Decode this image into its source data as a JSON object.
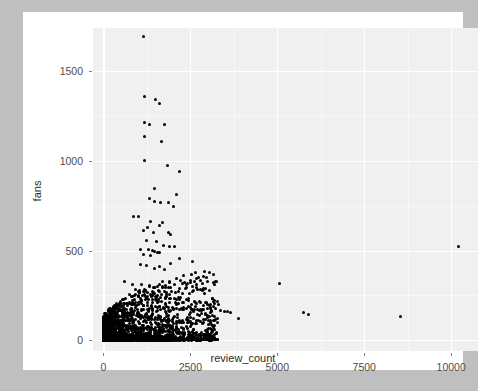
{
  "window": {
    "backdrop_color": "#bfbfbf",
    "card_color": "#ffffff"
  },
  "chart_data": {
    "type": "scatter",
    "title": "",
    "xlabel": "review_count",
    "ylabel": "fans",
    "xlim": [
      -300,
      10800
    ],
    "ylim": [
      -60,
      1740
    ],
    "xticks": [
      0,
      2500,
      5000,
      7500,
      10000
    ],
    "yticks": [
      0,
      500,
      1000,
      1500
    ],
    "xtick_labels": [
      "0",
      "2500",
      "5000",
      "7500",
      "10000"
    ],
    "ytick_labels": [
      "0",
      "500",
      "1000",
      "1500"
    ],
    "grid": true,
    "grid_color": "#ffffff",
    "panel_color": "#f0f0f0",
    "point_color": "#000000",
    "point_size": 3,
    "legend": "none",
    "n_points_note": "dense cluster near origin; sparse high-fan and high-review outliers",
    "points": [
      [
        1160,
        1690
      ],
      [
        1170,
        1360
      ],
      [
        1500,
        1340
      ],
      [
        1620,
        1320
      ],
      [
        1180,
        1215
      ],
      [
        1330,
        1205
      ],
      [
        1750,
        1200
      ],
      [
        1190,
        1135
      ],
      [
        1660,
        1110
      ],
      [
        1175,
        1000
      ],
      [
        1840,
        975
      ],
      [
        2190,
        940
      ],
      [
        1480,
        845
      ],
      [
        2110,
        810
      ],
      [
        1330,
        790
      ],
      [
        1470,
        775
      ],
      [
        1630,
        770
      ],
      [
        1880,
        765
      ],
      [
        2010,
        745
      ],
      [
        870,
        690
      ],
      [
        1010,
        690
      ],
      [
        1340,
        660
      ],
      [
        1710,
        655
      ],
      [
        1600,
        640
      ],
      [
        1270,
        630
      ],
      [
        1155,
        612
      ],
      [
        1430,
        600
      ],
      [
        1880,
        600
      ],
      [
        1930,
        590
      ],
      [
        1240,
        555
      ],
      [
        1520,
        550
      ],
      [
        1740,
        530
      ],
      [
        1890,
        525
      ],
      [
        2050,
        520
      ],
      [
        10210,
        520
      ],
      [
        1060,
        505
      ],
      [
        1310,
        505
      ],
      [
        1400,
        500
      ],
      [
        1455,
        495
      ],
      [
        1560,
        490
      ],
      [
        1620,
        488
      ],
      [
        1150,
        480
      ],
      [
        1350,
        470
      ],
      [
        2180,
        455
      ],
      [
        2550,
        440
      ],
      [
        1930,
        430
      ],
      [
        1075,
        420
      ],
      [
        1230,
        418
      ],
      [
        1620,
        412
      ],
      [
        1480,
        400
      ],
      [
        1760,
        395
      ],
      [
        620,
        330
      ],
      [
        3000,
        325
      ],
      [
        2320,
        320
      ],
      [
        2410,
        318
      ],
      [
        5060,
        315
      ],
      [
        850,
        310
      ],
      [
        1100,
        308
      ],
      [
        1330,
        305
      ],
      [
        1560,
        300
      ],
      [
        1700,
        298
      ],
      [
        1860,
        295
      ],
      [
        2190,
        290
      ],
      [
        920,
        280
      ],
      [
        1040,
        278
      ],
      [
        1210,
        275
      ],
      [
        1410,
        272
      ],
      [
        1620,
        270
      ],
      [
        1800,
        268
      ],
      [
        2060,
        265
      ],
      [
        2280,
        262
      ],
      [
        760,
        255
      ],
      [
        880,
        252
      ],
      [
        1000,
        250
      ],
      [
        1130,
        248
      ],
      [
        1260,
        245
      ],
      [
        1390,
        243
      ],
      [
        1520,
        240
      ],
      [
        1640,
        238
      ],
      [
        1780,
        235
      ],
      [
        1910,
        233
      ],
      [
        2040,
        230
      ],
      [
        2180,
        228
      ],
      [
        2450,
        222
      ],
      [
        2610,
        218
      ],
      [
        2760,
        214
      ],
      [
        2960,
        210
      ],
      [
        600,
        205
      ],
      [
        700,
        203
      ],
      [
        800,
        201
      ],
      [
        900,
        199
      ],
      [
        1020,
        197
      ],
      [
        1140,
        195
      ],
      [
        1260,
        193
      ],
      [
        1380,
        191
      ],
      [
        1500,
        189
      ],
      [
        1620,
        187
      ],
      [
        1740,
        185
      ],
      [
        1860,
        183
      ],
      [
        1980,
        181
      ],
      [
        2100,
        179
      ],
      [
        2240,
        177
      ],
      [
        2380,
        175
      ],
      [
        2540,
        173
      ],
      [
        2700,
        171
      ],
      [
        2880,
        169
      ],
      [
        3120,
        166
      ],
      [
        3380,
        163
      ],
      [
        3480,
        161
      ],
      [
        3560,
        159
      ],
      [
        3650,
        157
      ],
      [
        5760,
        152
      ],
      [
        5910,
        146
      ],
      [
        8530,
        130
      ],
      [
        3880,
        120
      ],
      [
        3180,
        112
      ],
      [
        400,
        175
      ],
      [
        450,
        170
      ],
      [
        500,
        165
      ],
      [
        550,
        160
      ],
      [
        350,
        155
      ],
      [
        300,
        150
      ],
      [
        260,
        145
      ],
      [
        230,
        140
      ],
      [
        620,
        158
      ],
      [
        680,
        154
      ],
      [
        740,
        150
      ],
      [
        810,
        146
      ],
      [
        870,
        142
      ],
      [
        940,
        138
      ],
      [
        1010,
        135
      ],
      [
        1080,
        132
      ],
      [
        1150,
        129
      ],
      [
        1230,
        126
      ],
      [
        1310,
        123
      ],
      [
        1390,
        120
      ],
      [
        1470,
        118
      ],
      [
        1550,
        116
      ],
      [
        1630,
        114
      ],
      [
        1720,
        112
      ],
      [
        1810,
        110
      ],
      [
        1900,
        108
      ],
      [
        1990,
        106
      ],
      [
        2090,
        104
      ],
      [
        2190,
        102
      ],
      [
        2300,
        100
      ],
      [
        2420,
        98
      ],
      [
        2550,
        96
      ],
      [
        2690,
        94
      ],
      [
        2840,
        92
      ],
      [
        3010,
        88
      ],
      [
        3200,
        84
      ],
      [
        100,
        130
      ],
      [
        130,
        126
      ],
      [
        160,
        122
      ],
      [
        190,
        118
      ],
      [
        220,
        114
      ],
      [
        250,
        110
      ],
      [
        280,
        106
      ],
      [
        310,
        102
      ],
      [
        340,
        99
      ],
      [
        380,
        96
      ],
      [
        420,
        93
      ],
      [
        460,
        90
      ],
      [
        500,
        88
      ],
      [
        545,
        86
      ],
      [
        590,
        84
      ],
      [
        640,
        82
      ],
      [
        690,
        80
      ],
      [
        745,
        78
      ],
      [
        800,
        76
      ],
      [
        860,
        74
      ],
      [
        920,
        72
      ],
      [
        985,
        70
      ],
      [
        1050,
        68
      ],
      [
        1120,
        66
      ],
      [
        1195,
        64
      ],
      [
        1270,
        62
      ],
      [
        1350,
        60
      ],
      [
        1430,
        58
      ],
      [
        1515,
        56
      ],
      [
        1600,
        54
      ],
      [
        1690,
        52
      ],
      [
        1785,
        50
      ],
      [
        1885,
        48
      ],
      [
        1990,
        46
      ],
      [
        2100,
        44
      ],
      [
        2215,
        42
      ],
      [
        2340,
        40
      ],
      [
        2470,
        38
      ],
      [
        2610,
        36
      ],
      [
        2760,
        34
      ],
      [
        2930,
        30
      ],
      [
        3100,
        26
      ],
      [
        40,
        120
      ],
      [
        55,
        112
      ],
      [
        70,
        105
      ],
      [
        85,
        98
      ],
      [
        100,
        92
      ],
      [
        115,
        86
      ],
      [
        130,
        80
      ],
      [
        150,
        75
      ],
      [
        170,
        70
      ],
      [
        190,
        66
      ],
      [
        210,
        62
      ],
      [
        235,
        58
      ],
      [
        260,
        55
      ],
      [
        290,
        52
      ],
      [
        320,
        49
      ],
      [
        350,
        46
      ],
      [
        385,
        44
      ],
      [
        420,
        42
      ],
      [
        460,
        40
      ],
      [
        500,
        38
      ],
      [
        545,
        36
      ],
      [
        590,
        34
      ],
      [
        640,
        32
      ],
      [
        695,
        30
      ],
      [
        750,
        29
      ],
      [
        810,
        28
      ],
      [
        875,
        27
      ],
      [
        940,
        26
      ],
      [
        1010,
        25
      ],
      [
        1085,
        24
      ],
      [
        1160,
        23
      ],
      [
        1240,
        22
      ],
      [
        1325,
        21
      ],
      [
        1415,
        20
      ],
      [
        1510,
        19
      ],
      [
        1610,
        18
      ],
      [
        1715,
        17
      ],
      [
        1825,
        16
      ],
      [
        1940,
        15
      ],
      [
        2060,
        14
      ],
      [
        2190,
        13
      ],
      [
        2330,
        12
      ],
      [
        2480,
        11
      ],
      [
        2640,
        10
      ],
      [
        2810,
        9
      ],
      [
        3000,
        8
      ]
    ]
  },
  "axes": {
    "x_title": "review_count",
    "y_title": "fans"
  }
}
